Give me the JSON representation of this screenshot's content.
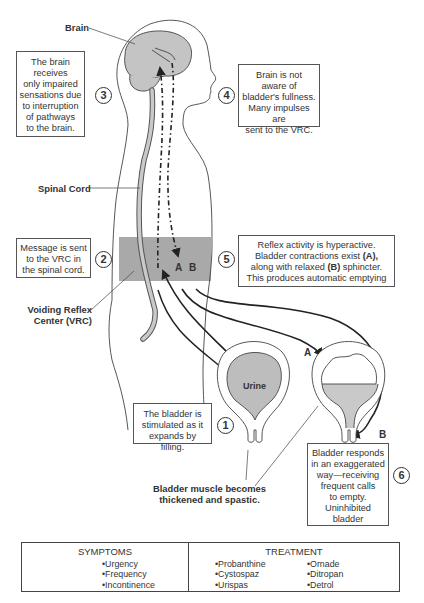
{
  "labels": {
    "brain": "Brain",
    "spinal_cord": "Spinal Cord",
    "vrc_line1": "Voiding Reflex",
    "vrc_line2": "Center (VRC)",
    "urine": "Urine",
    "muscle_line1": "Bladder muscle becomes",
    "muscle_line2": "thickened and spastic.",
    "a": "A",
    "b": "B",
    "a2": "A",
    "b2": "B"
  },
  "steps": [
    {
      "num": "1",
      "lines": [
        "The bladder is",
        "stimulated as it",
        "expands by filling."
      ]
    },
    {
      "num": "2",
      "lines": [
        "Message is sent",
        "to the VRC in",
        "the spinal cord."
      ]
    },
    {
      "num": "3",
      "lines": [
        "The brain",
        "receives",
        "only impaired",
        "sensations due",
        "to interruption",
        "of pathways",
        "to the brain."
      ]
    },
    {
      "num": "4",
      "lines": [
        "Brain is not",
        "aware of",
        "bladder's fullness.",
        "Many impulses are",
        "sent to the VRC."
      ]
    },
    {
      "num": "5",
      "lines": [
        "Reflex activity is hyperactive.",
        "Bladder contractions exist",
        "(A),",
        "along with relaxed",
        "(B)",
        "sphincter.",
        "This produces automatic emptying"
      ]
    },
    {
      "num": "6",
      "lines": [
        "Bladder responds",
        "in an exaggerated",
        "way—receiving",
        "frequent calls",
        "to empty.",
        "Uninhibited",
        "bladder"
      ]
    }
  ],
  "table": {
    "symptoms_title": "SYMPTOMS",
    "symptoms": [
      "Urgency",
      "Frequency",
      "Incontinence"
    ],
    "treatment_title": "TREATMENT",
    "treatment_col1": [
      "Probanthine",
      "Cystospaz",
      "Urispas"
    ],
    "treatment_col2": [
      "Ornade",
      "Ditropan",
      "Detrol"
    ]
  },
  "colors": {
    "organ_fill": "#bdbdbd",
    "vrc_band": "#a9a9a9",
    "line": "#333333"
  }
}
